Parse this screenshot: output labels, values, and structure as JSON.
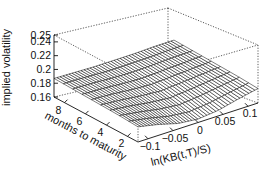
{
  "chart_data": {
    "type": "surface3d",
    "title": "",
    "zlabel": "implied volatility",
    "ylabel": "months to maturity",
    "xlabel": "ln(KB(t,T)/S)",
    "zlim": [
      0.16,
      0.25
    ],
    "ylim": [
      1,
      9
    ],
    "xlim": [
      -0.12,
      0.12
    ],
    "z_ticks": [
      "0.25",
      "0.24",
      "0.22",
      "0.2",
      "0.18",
      "0.16"
    ],
    "y_ticks": [
      "8",
      "6",
      "4",
      "2"
    ],
    "x_ticks": [
      "-0.1",
      "-0.05",
      "0",
      "0.05",
      "0.1"
    ],
    "grid": false,
    "box": "dotted",
    "surface": {
      "description": "Implied volatility smile surface; roughly flat near 0.18-0.19 with a dip toward ~0.165 near ln-moneyness 0 at short maturities",
      "x": [
        -0.12,
        -0.08,
        -0.04,
        0.0,
        0.04,
        0.08,
        0.12
      ],
      "y": [
        1,
        3,
        5,
        7,
        9
      ],
      "z": [
        [
          0.182,
          0.176,
          0.168,
          0.165,
          0.168,
          0.175,
          0.181
        ],
        [
          0.184,
          0.18,
          0.175,
          0.172,
          0.175,
          0.179,
          0.183
        ],
        [
          0.185,
          0.183,
          0.18,
          0.178,
          0.18,
          0.182,
          0.184
        ],
        [
          0.186,
          0.185,
          0.183,
          0.182,
          0.183,
          0.184,
          0.185
        ],
        [
          0.187,
          0.186,
          0.185,
          0.185,
          0.185,
          0.186,
          0.186
        ]
      ]
    }
  }
}
